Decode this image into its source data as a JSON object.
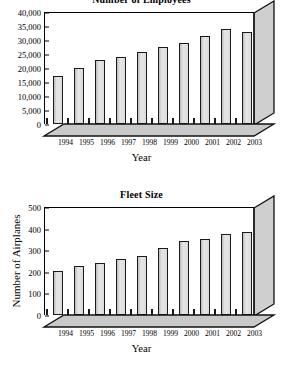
{
  "chart_data": [
    {
      "type": "bar",
      "title": "Number of Employees",
      "xlabel": "Year",
      "ylabel": "",
      "categories": [
        "1994",
        "1995",
        "1996",
        "1997",
        "1998",
        "1999",
        "2000",
        "2001",
        "2002",
        "2003"
      ],
      "values": [
        17000,
        20000,
        23000,
        24000,
        25700,
        27500,
        29000,
        31500,
        34000,
        33000
      ],
      "ylim": [
        0,
        40000
      ],
      "ytick_values": [
        0,
        5000,
        10000,
        15000,
        20000,
        25000,
        30000,
        35000,
        40000
      ],
      "ytick_labels": [
        "0",
        "5,000",
        "10,000",
        "15,000",
        "20,000",
        "25,000",
        "30,000",
        "35,000",
        "40,000"
      ],
      "grid": false,
      "legend": "none",
      "bar_color": "#d2d2d2",
      "bar_edge_color": "#1a1a1a"
    },
    {
      "type": "bar",
      "title": "Fleet Size",
      "xlabel": "Year",
      "ylabel": "Number of Airplanes",
      "categories": [
        "1994",
        "1995",
        "1996",
        "1997",
        "1998",
        "1999",
        "2000",
        "2001",
        "2002",
        "2003"
      ],
      "values": [
        203,
        226,
        240,
        258,
        275,
        310,
        343,
        351,
        376,
        386
      ],
      "ylim": [
        0,
        500
      ],
      "ytick_values": [
        0,
        100,
        200,
        300,
        400,
        500
      ],
      "ytick_labels": [
        "0",
        "100",
        "200",
        "300",
        "400",
        "500"
      ],
      "grid": false,
      "legend": "none",
      "bar_color": "#d2d2d2",
      "bar_edge_color": "#1a1a1a"
    }
  ]
}
